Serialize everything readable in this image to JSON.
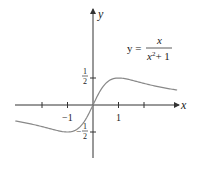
{
  "chart_data": {
    "type": "line",
    "title": "",
    "equation": {
      "lhs": "y =",
      "numerator": "x",
      "denominator": "x² + 1",
      "denominator_base": "x",
      "denominator_exp": "2",
      "denominator_rest": "+ 1"
    },
    "xlabel": "x",
    "ylabel": "y",
    "x_tick_labels": [
      {
        "value": -1,
        "label": "−1"
      },
      {
        "value": 1,
        "label": "1"
      }
    ],
    "x_ticks": [
      -2,
      -1,
      0,
      1,
      2
    ],
    "y_tick_labels": [
      {
        "value": 0.5,
        "num": "1",
        "den": "2",
        "sign": ""
      },
      {
        "value": -0.5,
        "num": "1",
        "den": "2",
        "sign": "−"
      }
    ],
    "xlim": [
      -3.1,
      3.3
    ],
    "ylim": [
      -1.0,
      1.75
    ],
    "grid": false,
    "series": [
      {
        "name": "y = x/(x^2+1)",
        "function": "x/(x^2+1)",
        "x": [
          -3.0,
          -2.5,
          -2.0,
          -1.5,
          -1.0,
          -0.5,
          0.0,
          0.5,
          1.0,
          1.5,
          2.0,
          2.5,
          3.0
        ],
        "values": [
          -0.3,
          -0.345,
          -0.4,
          -0.462,
          -0.5,
          -0.4,
          0.0,
          0.4,
          0.5,
          0.462,
          0.4,
          0.345,
          0.3
        ]
      }
    ],
    "colors": {
      "axis": "#333333",
      "curve": "#888888",
      "text": "#222222"
    }
  }
}
